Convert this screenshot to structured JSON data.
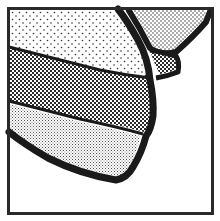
{
  "map": {
    "description": "Stylized coastline map with stipple-patterned land bands",
    "colors": {
      "background": "#ffffff",
      "ink": "#1a1a1a",
      "border": "#2a2a2a"
    },
    "regions": [
      {
        "id": "upper-light-band",
        "pattern": "sparse-dots"
      },
      {
        "id": "middle-dense-band",
        "pattern": "dense-checker"
      },
      {
        "id": "lower-fine-band",
        "pattern": "fine-dots"
      },
      {
        "id": "top-right-island",
        "pattern": "medium-dots"
      },
      {
        "id": "small-inlet-patch",
        "pattern": "dense-checker"
      },
      {
        "id": "sea",
        "pattern": "none"
      }
    ]
  }
}
